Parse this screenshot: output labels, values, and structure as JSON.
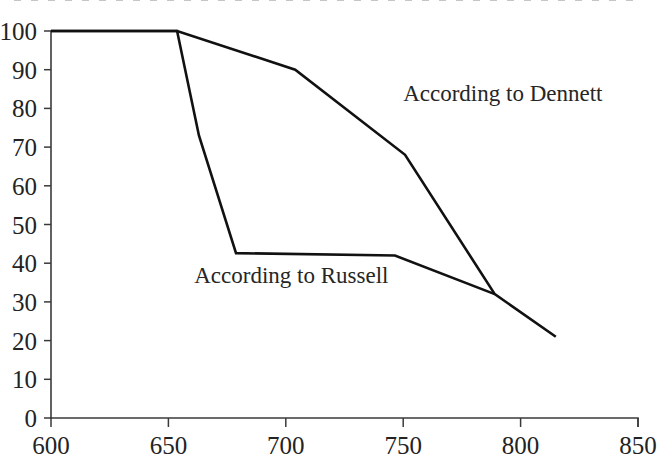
{
  "chart_data": {
    "type": "line",
    "title": "",
    "xlabel": "",
    "ylabel": "",
    "xlim": [
      600,
      850
    ],
    "ylim": [
      0,
      100
    ],
    "xticks": [
      600,
      650,
      700,
      750,
      800,
      850
    ],
    "yticks": [
      0,
      10,
      20,
      30,
      40,
      50,
      60,
      70,
      80,
      90,
      100
    ],
    "grid": false,
    "legend_position": "inline-annotations",
    "series": [
      {
        "name": "According to Dennett",
        "color": "#111111",
        "label_x": 750,
        "label_y": 82,
        "x": [
          600,
          653.7,
          704,
          750.8,
          789,
          815
        ],
        "y": [
          100,
          100,
          90,
          68,
          32,
          21
        ]
      },
      {
        "name": "According to Russell",
        "color": "#111111",
        "label_x": 661,
        "label_y": 35,
        "x": [
          600,
          653.7,
          663,
          678.8,
          746.5,
          789
        ],
        "y": [
          100,
          100,
          73,
          42.6,
          42,
          32
        ]
      }
    ],
    "annotations": [
      {
        "text": "According to Dennett",
        "x": 750,
        "y": 82
      },
      {
        "text": "According to Russell",
        "x": 661,
        "y": 35
      }
    ]
  },
  "axes": {
    "x_tick_labels": [
      "600",
      "650",
      "700",
      "750",
      "800",
      "850"
    ],
    "y_tick_labels": [
      "100",
      "90",
      "80",
      "70",
      "60",
      "50",
      "40",
      "30",
      "20",
      "10",
      "0"
    ]
  },
  "labels": {
    "dennett": "According to Dennett",
    "russell": "According to Russell"
  },
  "colors": {
    "ink": "#111111",
    "axis": "#3a3a3a",
    "text": "#232323",
    "background": "#ffffff"
  }
}
